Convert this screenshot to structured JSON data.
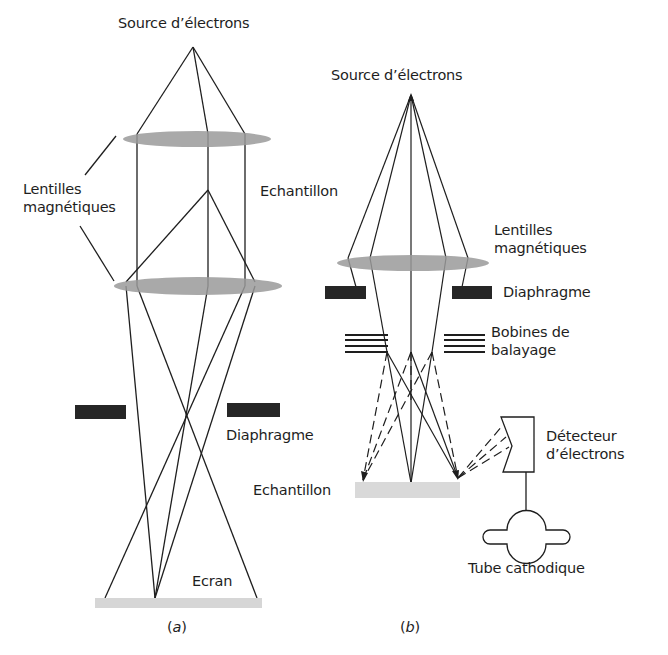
{
  "panel_a": {
    "caption_open": "(",
    "caption_letter": "a",
    "caption_close": ")",
    "labels": {
      "source": "Source d’électrons",
      "lenses_line1": "Lentilles",
      "lenses_line2": "magnétiques",
      "sample": "Echantillon",
      "diaphragm": "Diaphragme",
      "screen": "Ecran"
    }
  },
  "panel_b": {
    "caption_open": "(",
    "caption_letter": "b",
    "caption_close": ")",
    "labels": {
      "source": "Source d’électrons",
      "lenses_line1": "Lentilles",
      "lenses_line2": "magnétiques",
      "diaphragm": "Diaphragme",
      "coils_line1": "Bobines de",
      "coils_line2": "balayage",
      "sample": "Echantillon",
      "detector_line1": "Détecteur",
      "detector_line2": "d’électrons",
      "crt": "Tube cathodique"
    }
  },
  "colors": {
    "ink": "#1e1e1e",
    "lens": "#9a9a9a",
    "diaphragm": "#262626",
    "screen": "#d6d6d6",
    "sample": "#d9d9d9"
  }
}
